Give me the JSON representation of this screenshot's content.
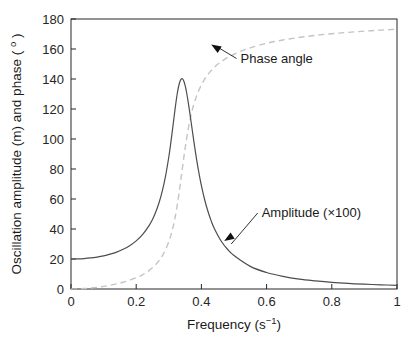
{
  "chart_data": {
    "type": "line",
    "title": "",
    "xlabel": "Frequency (s⁻¹)",
    "ylabel": "Oscillation amplitude (m) and phase ( ° )",
    "xlim": [
      0,
      1
    ],
    "ylim": [
      0,
      180
    ],
    "grid": false,
    "legend_position": "none",
    "xticks": [
      "0",
      "0.2",
      "0.4",
      "0.6",
      "0.8",
      "1"
    ],
    "xtick_values": [
      0,
      0.2,
      0.4,
      0.6,
      0.8,
      1
    ],
    "yticks": [
      "0",
      "20",
      "40",
      "60",
      "80",
      "100",
      "120",
      "140",
      "160",
      "180"
    ],
    "ytick_values": [
      0,
      20,
      40,
      60,
      80,
      100,
      120,
      140,
      160,
      180
    ],
    "series": [
      {
        "name": "Amplitude (×100)",
        "style": "solid",
        "color": "#4d4d4d",
        "x": [
          0.0,
          0.02,
          0.04,
          0.06,
          0.08,
          0.1,
          0.12,
          0.14,
          0.16,
          0.18,
          0.2,
          0.22,
          0.24,
          0.25,
          0.26,
          0.27,
          0.28,
          0.29,
          0.3,
          0.305,
          0.31,
          0.315,
          0.32,
          0.325,
          0.33,
          0.335,
          0.34,
          0.345,
          0.35,
          0.355,
          0.36,
          0.365,
          0.37,
          0.375,
          0.38,
          0.385,
          0.39,
          0.4,
          0.41,
          0.42,
          0.43,
          0.44,
          0.46,
          0.48,
          0.5,
          0.55,
          0.6,
          0.65,
          0.7,
          0.75,
          0.8,
          0.85,
          0.9,
          0.95,
          1.0
        ],
        "values": [
          20.0,
          20.1,
          20.3,
          20.7,
          21.3,
          22.1,
          23.2,
          24.6,
          26.5,
          28.9,
          32.1,
          36.4,
          42.4,
          46.4,
          51.3,
          57.5,
          65.3,
          75.3,
          88.0,
          95.6,
          103.9,
          112.6,
          121.2,
          129.0,
          135.0,
          138.8,
          140.2,
          139.1,
          135.7,
          130.5,
          123.9,
          116.6,
          108.9,
          101.2,
          93.8,
          86.8,
          80.3,
          68.9,
          59.5,
          51.8,
          45.4,
          40.2,
          32.2,
          26.5,
          22.3,
          15.1,
          11.0,
          8.4,
          6.6,
          5.4,
          4.4,
          3.7,
          3.2,
          2.8,
          2.4
        ]
      },
      {
        "name": "Phase angle",
        "style": "dashed",
        "color": "#c4c4c4",
        "x": [
          0.0,
          0.04,
          0.08,
          0.12,
          0.16,
          0.2,
          0.22,
          0.24,
          0.26,
          0.27,
          0.28,
          0.29,
          0.3,
          0.305,
          0.31,
          0.315,
          0.32,
          0.325,
          0.33,
          0.335,
          0.34,
          0.345,
          0.35,
          0.355,
          0.36,
          0.365,
          0.37,
          0.375,
          0.38,
          0.39,
          0.4,
          0.41,
          0.42,
          0.43,
          0.44,
          0.45,
          0.46,
          0.48,
          0.5,
          0.52,
          0.55,
          0.6,
          0.65,
          0.7,
          0.75,
          0.8,
          0.85,
          0.9,
          0.95,
          1.0
        ],
        "values": [
          0.0,
          0.3,
          1.1,
          2.5,
          4.5,
          7.5,
          9.6,
          12.4,
          16.3,
          18.9,
          22.1,
          26.2,
          31.5,
          34.8,
          38.6,
          43.1,
          48.5,
          54.7,
          61.8,
          69.6,
          77.8,
          86.0,
          93.7,
          100.8,
          107.2,
          112.8,
          117.6,
          121.8,
          125.4,
          131.4,
          136.1,
          139.9,
          143.0,
          145.6,
          147.8,
          149.8,
          151.4,
          154.2,
          156.5,
          158.4,
          160.8,
          163.8,
          166.0,
          167.7,
          169.1,
          170.2,
          171.1,
          171.9,
          172.6,
          173.2
        ]
      }
    ],
    "annotations": [
      {
        "label": "Phase angle",
        "text_x": 0.52,
        "text_y": 151,
        "arrow_tip_x": 0.43,
        "arrow_tip_y": 163
      },
      {
        "label": "Amplitude (×100)",
        "text_x": 0.585,
        "text_y": 48,
        "arrow_tip_x": 0.47,
        "arrow_tip_y": 32
      }
    ]
  },
  "axes": {
    "ylabel_main": "Oscillation amplitude (m) and phase ( ",
    "ylabel_degree": "o",
    "ylabel_tail": " )",
    "xlabel_main": "Frequency (s",
    "xlabel_exp": "−1",
    "xlabel_tail": ")"
  },
  "colors": {
    "axis": "#262626",
    "amplitude_curve": "#4d4d4d",
    "phase_curve": "#c4c4c4",
    "annotation": "#1a1a1a",
    "background": "#ffffff"
  }
}
